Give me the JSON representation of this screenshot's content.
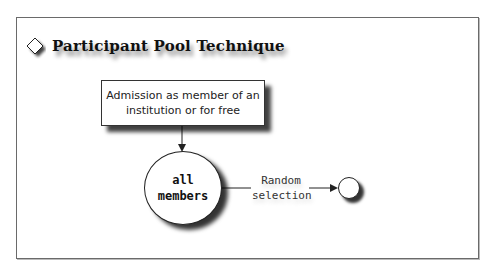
{
  "title": "Participant Pool Technique",
  "nodes": {
    "admission_box": {
      "line1": "Admission as member of an",
      "line2": "institution or for free"
    },
    "population_circle": {
      "line1": "all",
      "line2": "members"
    },
    "sample_circle": {}
  },
  "edges": [
    {
      "from": "admission_box",
      "to": "population_circle",
      "label": ""
    },
    {
      "from": "population_circle",
      "to": "sample_circle",
      "label_line1": "Random",
      "label_line2": "selection"
    }
  ],
  "icons": {
    "title_bullet": "diamond-icon"
  }
}
